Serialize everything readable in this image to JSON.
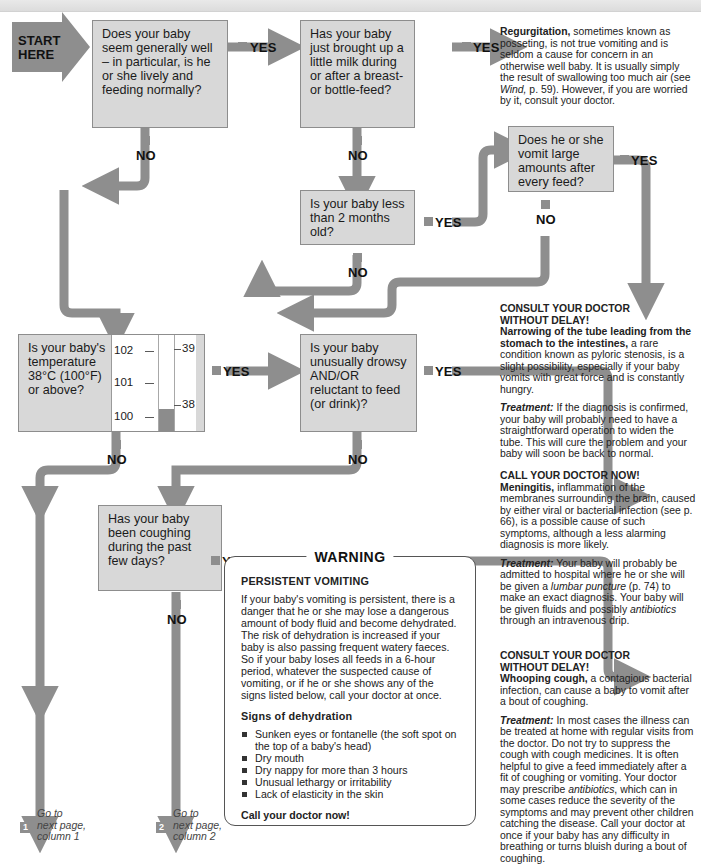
{
  "page": {
    "start_label_line1": "START",
    "start_label_line2": "HERE",
    "yes": "YES",
    "no": "NO"
  },
  "boxes": {
    "q1": "Does your baby seem generally well – in particular, is he or she lively and feeding normally?",
    "q2": "Has your baby just brought up a little milk during or after a breast- or bottle-feed?",
    "q3": "Does he or she vomit large amounts after every feed?",
    "q4": "Is your baby less than 2 months old?",
    "q5": "Is your baby's temperature 38°C (100°F) or above?",
    "q6": "Is your baby unusually drowsy AND/OR reluctant to feed (or drink)?",
    "q7": "Has your baby been coughing during the past few days?"
  },
  "thermometer": {
    "f_labels": [
      "102",
      "101",
      "100"
    ],
    "c_labels": [
      "39",
      "38"
    ]
  },
  "advice": {
    "regurgitation": {
      "lead": "Regurgitation,",
      "body1": " sometimes known as posseting, is not true vomiting and is seldom a cause for concern in an otherwise well baby. It is usually simply the result of swallowing too much air (see ",
      "italic1": "Wind,",
      "body2": " p. 59). However, if you are worried by it, consult your doctor."
    },
    "pyloric": {
      "head1": "CONSULT YOUR DOCTOR",
      "head2": "WITHOUT DELAY!",
      "lead": "Narrowing of the tube leading from the stomach to the intestines,",
      "body": " a rare condition known as pyloric stenosis, is a slight possibility, especially if your baby vomits with great force and is constantly hungry.",
      "treat_label": "Treatment:",
      "treat_body": " If the diagnosis is confirmed, your baby will probably need to have a straightforward operation to widen the tube. This will cure the problem and your baby will soon be back to normal."
    },
    "meningitis": {
      "head1": "CALL YOUR DOCTOR NOW!",
      "lead": "Meningitis,",
      "body": " inflammation of the membranes surrounding the brain, caused by either viral or bacterial infection (see p. 66), is a possible cause of such symptoms, although a less alarming diagnosis is more likely.",
      "treat_label": "Treatment:",
      "treat_body1": " Your baby will probably be admitted to hospital where he or she will be given a ",
      "treat_italic1": "lumbar puncture",
      "treat_body2": " (p. 74) to make an exact diagnosis. Your baby will be given fluids and possibly ",
      "treat_italic2": "antibiotics",
      "treat_body3": " through an intravenous drip."
    },
    "whooping": {
      "head1": "CONSULT YOUR DOCTOR",
      "head2": "WITHOUT DELAY!",
      "lead": "Whooping cough,",
      "body": " a contagious bacterial infection, can cause a baby to vomit after a bout of coughing.",
      "treat_label": "Treatment:",
      "treat_body1": " In most cases the illness can be treated at home with regular visits from the doctor. Do not try to suppress the cough with cough medicines. It is often helpful to give a feed immediately after a fit of coughing or vomiting. Your doctor may prescribe ",
      "treat_italic1": "antibiotics",
      "treat_body2": ", which can in some cases reduce the severity of the symptoms and may prevent other children catching the disease. Call your doctor at once if your baby has any difficulty in breathing or turns bluish during a bout of coughing."
    }
  },
  "warning": {
    "title": "WARNING",
    "subhead": "PERSISTENT VOMITING",
    "body": "If your baby's vomiting is persistent, there is a danger that he or she may lose a dangerous amount of body fluid and become dehydrated. The risk of dehydration is increased if your baby is also passing frequent watery faeces. So if your baby loses all feeds in a 6-hour period, whatever the suspected cause of vomiting, or if he or she shows any of the signs listed below, call your doctor at once.",
    "signs_head": "Signs of dehydration",
    "signs": [
      "Sunken eyes or fontanelle (the soft spot on the top of a baby's head)",
      "Dry mouth",
      "Dry nappy for more than 3 hours",
      "Unusual lethargy or irritability",
      "Lack of elasticity in the skin"
    ],
    "call": "Call your doctor now!"
  },
  "footer": {
    "goto1_num": "1",
    "goto1_l1": "Go to",
    "goto1_l2": "next page,",
    "goto1_l3": "column 1",
    "goto2_num": "2",
    "goto2_l1": "Go to",
    "goto2_l2": "next page,",
    "goto2_l3": "column 2"
  },
  "colors": {
    "arrow": "#8e8e8e",
    "box_fill": "#d8d8d8",
    "box_border": "#8d8d8d",
    "text": "#1b1b1b"
  }
}
